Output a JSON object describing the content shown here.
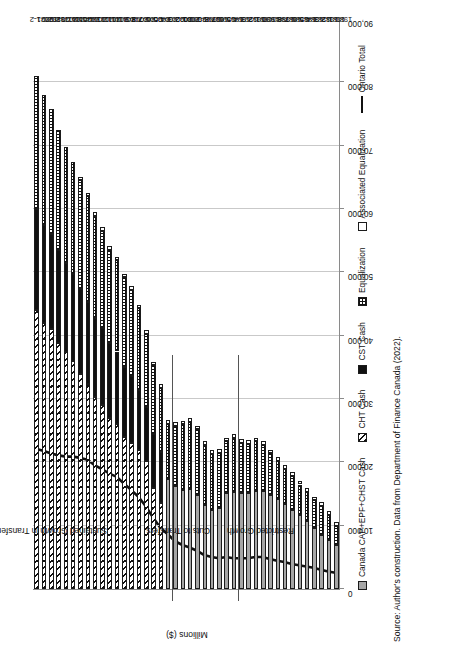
{
  "figure": {
    "source_note": "Source: Author's construction. Data from Department of Finance Canada (2022)."
  },
  "chart_data": {
    "type": "bar",
    "orientation": "horizontal-stacked",
    "title": "",
    "xlabel": "Millions ($)",
    "ylabel": "",
    "axis_title": "Millions ($)",
    "xlim": [
      0,
      90000
    ],
    "xticks": [
      0,
      10000,
      20000,
      30000,
      40000,
      50000,
      60000,
      70000,
      80000,
      90000
    ],
    "xtick_labels": [
      "0",
      "10,000",
      "20,000",
      "30,000",
      "40,000",
      "50,000",
      "60,000",
      "70,000",
      "80,000",
      "90,000"
    ],
    "grid": true,
    "legend_position": "bottom",
    "legend": [
      {
        "key": "capcash",
        "label": "Canada CAP+EPF+CHST Cash",
        "style": "solid-grey"
      },
      {
        "key": "cht",
        "label": "CHT Cash",
        "style": "diagonal-hatch"
      },
      {
        "key": "cst",
        "label": "CST Cash",
        "style": "solid-black"
      },
      {
        "key": "eq",
        "label": "Equalization",
        "style": "checker"
      },
      {
        "key": "aeq",
        "label": "Associated Equalization",
        "style": "hollow-white"
      },
      {
        "key": "ontario",
        "label": "Ontario Total",
        "style": "thick-black-line"
      }
    ],
    "categories": [
      "1980-1",
      "1981-2",
      "1982-3",
      "1983-4",
      "1984-5",
      "1985-6",
      "1986-7",
      "1987-8",
      "1988-9",
      "1989-90",
      "1990-1",
      "1991-2",
      "1992-3",
      "1993-4",
      "1994-5",
      "1995-6",
      "1996-7",
      "1997-8",
      "1998-9",
      "1999-2000",
      "2000-1",
      "2001-2",
      "2002-3",
      "2003-4",
      "2004-5",
      "2005-6",
      "2006-7",
      "2007-8",
      "2008-9",
      "2009-10",
      "2010-11",
      "2011-12",
      "2012-13",
      "2013-14",
      "2014-15",
      "2015-16",
      "2016-17",
      "2017-18",
      "2018-19",
      "2019-20",
      "2020-1",
      "2021-2"
    ],
    "series": [
      {
        "name": "Canada CAP+EPF+CHST Cash",
        "key": "capcash",
        "values": [
          6900,
          7700,
          8600,
          9700,
          10700,
          11700,
          12400,
          13400,
          14200,
          14900,
          15400,
          15400,
          15100,
          15100,
          15300,
          15100,
          12800,
          12500,
          13200,
          14900,
          15800,
          15700,
          16300,
          17300,
          0,
          0,
          0,
          0,
          0,
          0,
          0,
          0,
          0,
          0,
          0,
          0,
          0,
          0,
          0,
          0,
          0,
          0
        ]
      },
      {
        "name": "CHT Cash",
        "key": "cht",
        "values": [
          0,
          0,
          0,
          0,
          0,
          0,
          0,
          0,
          0,
          0,
          0,
          0,
          0,
          0,
          0,
          0,
          0,
          0,
          0,
          0,
          0,
          0,
          0,
          0,
          13500,
          16000,
          20200,
          22000,
          23000,
          24000,
          26000,
          27000,
          29000,
          30300,
          32400,
          34000,
          36000,
          37400,
          38900,
          41000,
          42000,
          44000
        ]
      },
      {
        "name": "CST Cash",
        "key": "cst",
        "values": [
          0,
          0,
          0,
          0,
          0,
          0,
          0,
          0,
          0,
          0,
          0,
          0,
          0,
          0,
          0,
          0,
          0,
          0,
          0,
          0,
          0,
          0,
          0,
          0,
          8200,
          8400,
          8600,
          9400,
          10600,
          11000,
          11500,
          11800,
          12200,
          12500,
          12900,
          13300,
          13700,
          14100,
          14600,
          15000,
          15500,
          16000
        ]
      },
      {
        "name": "Equalization",
        "key": "eq",
        "values": [
          3100,
          4000,
          4500,
          4300,
          4600,
          4800,
          5400,
          5600,
          6000,
          6500,
          7400,
          7900,
          7800,
          8000,
          8500,
          8200,
          8700,
          8800,
          9500,
          10300,
          10600,
          10300,
          9500,
          8800,
          10000,
          10900,
          11500,
          12900,
          13600,
          14200,
          14400,
          14800,
          15400,
          16100,
          16700,
          17300,
          17800,
          18300,
          18900,
          19800,
          20500,
          21000
        ]
      },
      {
        "name": "Associated Equalization",
        "key": "aeq",
        "values": [
          600,
          600,
          600,
          600,
          600,
          600,
          600,
          600,
          600,
          600,
          600,
          600,
          600,
          600,
          600,
          600,
          600,
          600,
          600,
          600,
          600,
          600,
          600,
          600,
          600,
          600,
          600,
          600,
          600,
          600,
          600,
          600,
          600,
          600,
          500,
          400,
          0,
          0,
          0,
          0,
          0,
          0
        ]
      }
    ],
    "ontario_total_line": {
      "name": "Ontario Total",
      "values": [
        2500,
        2700,
        3000,
        3300,
        3500,
        3700,
        3900,
        4200,
        4400,
        4700,
        5000,
        5000,
        4800,
        4800,
        4800,
        5000,
        4800,
        5000,
        5300,
        6000,
        6500,
        6900,
        7500,
        8600,
        9600,
        11200,
        13000,
        14500,
        15600,
        16600,
        17700,
        18200,
        18900,
        19500,
        20400,
        20700,
        20900,
        20900,
        21100,
        21400,
        21800,
        22100
      ]
    },
    "period_annotations": [
      {
        "label": "Restricted Growth",
        "start_category": "1980-1",
        "end_category": "1993-4"
      },
      {
        "label": "Cuts to Transfers",
        "start_category": "1994-5",
        "end_category": "2002-3"
      },
      {
        "label": "Sustained Growth in Transfers",
        "start_category": "2003-4",
        "end_category": "2021-2"
      }
    ]
  }
}
